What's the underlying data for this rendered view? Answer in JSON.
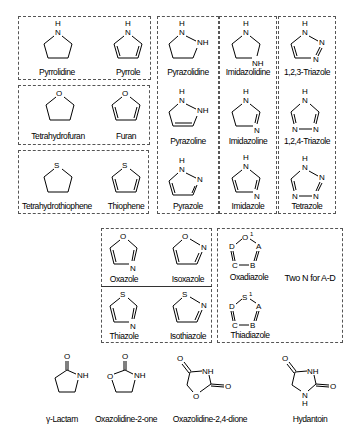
{
  "groups": {
    "pyrrole": [
      "Pyrrolidine",
      "Pyrrole"
    ],
    "furan": [
      "Tetrahydrofuran",
      "Furan"
    ],
    "thiophene": [
      "Tetrahydrothiophene",
      "Thiophene"
    ],
    "pyrazole": [
      "Pyrazolidine",
      "Pyrazoline",
      "Pyrazole"
    ],
    "imidazole": [
      "Imidazolidine",
      "Imidazoline",
      "Imidazole"
    ],
    "triazole": [
      "1,2,3-Triazole",
      "1,2,4-Triazole",
      "Tetrazole"
    ],
    "azole": [
      "Oxazole",
      "Isoxazole",
      "Thiazole",
      "Isothiazole"
    ],
    "diazole": [
      "Oxadiazole",
      "Thiadiazole"
    ],
    "diazole_note": "Two N for A-D",
    "bottom": [
      "γ-Lactam",
      "Oxazolidine-2-one",
      "Oxazolidine-2,4-dione",
      "Hydantoin"
    ]
  },
  "atoms": {
    "H": "H",
    "N": "N",
    "NH": "NH",
    "O": "O",
    "S": "S",
    "O1": "O",
    "S1": "S",
    "sup1": "1",
    "A": "A",
    "B": "B",
    "C": "C",
    "D": "D"
  }
}
